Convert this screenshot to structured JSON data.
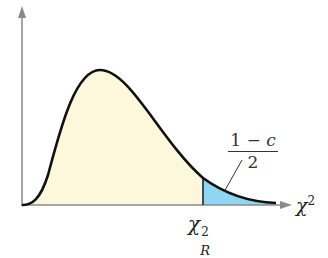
{
  "diagram": {
    "x_axis_label_base": "χ",
    "x_axis_label_sup": "2",
    "critical_value": {
      "base": "χ",
      "sup": "2",
      "sub": "R"
    },
    "tail_area_label": {
      "numerator_one": "1",
      "numerator_minus": " − ",
      "numerator_c": "c",
      "denominator": "2"
    },
    "colors": {
      "body_fill": "#fdf8dc",
      "tail_fill": "#8fd6f2",
      "curve": "#111111",
      "axes": "#888888"
    }
  }
}
